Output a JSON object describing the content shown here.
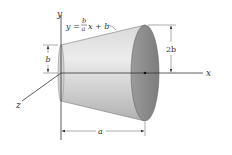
{
  "figure": {
    "equation": {
      "lhs": "y =",
      "frac_num": "b",
      "frac_den": "a",
      "rhs": "x + b"
    },
    "axes": {
      "x": "x",
      "y": "y",
      "z": "z"
    },
    "dimensions": {
      "left_radius": "b",
      "right_radius": "2b",
      "length": "a"
    },
    "colors": {
      "surface_light": "#e6e6e6",
      "surface_dark": "#b5b5b5",
      "end_face": "#8c8c8c",
      "line": "#333333"
    }
  }
}
